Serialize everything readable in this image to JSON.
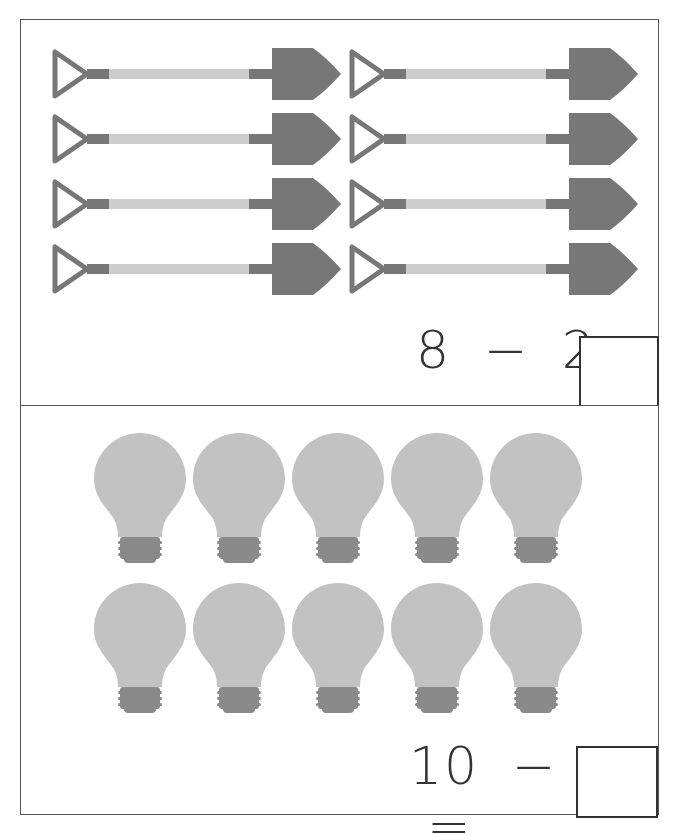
{
  "worksheet": {
    "problems": [
      {
        "object": "shovel",
        "count": 8,
        "equation": {
          "a": "8",
          "op": "−",
          "b": "2",
          "eq": "="
        },
        "answer": ""
      },
      {
        "object": "light-bulb",
        "count": 10,
        "equation": {
          "a": "10",
          "op": "−",
          "b": "4",
          "eq": "="
        },
        "answer": ""
      }
    ],
    "colors": {
      "shovel_dark": "#777777",
      "shovel_handle": "#cccccc",
      "bulb_glass": "#c2c2c2",
      "bulb_base": "#8a8a8a",
      "border": "#555555"
    }
  }
}
